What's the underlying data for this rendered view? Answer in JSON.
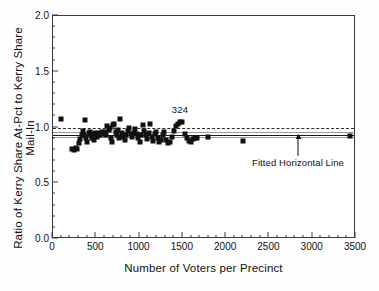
{
  "chart_data": {
    "type": "scatter",
    "title": "",
    "xlabel": "Number of Voters per Precinct",
    "ylabel": "Ratio of Kerry Share At-Pct to Kerry Share Mail-In",
    "xlim": [
      0,
      3500
    ],
    "ylim": [
      0.0,
      2.0
    ],
    "x_major_ticks": [
      0,
      500,
      1000,
      1500,
      2000,
      2500,
      3000,
      3500
    ],
    "x_tick_labels": [
      "0",
      "500",
      "1000",
      "1500",
      "2000",
      "2500",
      "3000",
      "3500"
    ],
    "x_minor_step": 100,
    "y_major_ticks": [
      0.0,
      0.5,
      1.0,
      1.5,
      2.0
    ],
    "y_tick_labels": [
      "0.0",
      "0.5",
      "1.0",
      "1.5",
      "2.0"
    ],
    "y_minor_step": 0.1,
    "grid": false,
    "legend": null,
    "marker": "filled-square",
    "marker_color": "#111111",
    "points": [
      [
        95,
        1.075
      ],
      [
        215,
        0.805
      ],
      [
        240,
        0.8
      ],
      [
        262,
        0.815
      ],
      [
        278,
        0.808
      ],
      [
        300,
        0.862
      ],
      [
        312,
        0.9
      ],
      [
        330,
        0.93
      ],
      [
        345,
        0.965
      ],
      [
        358,
        0.935
      ],
      [
        372,
        1.07
      ],
      [
        385,
        0.905
      ],
      [
        398,
        0.872
      ],
      [
        412,
        0.948
      ],
      [
        425,
        0.962
      ],
      [
        440,
        0.93
      ],
      [
        452,
        0.905
      ],
      [
        468,
        0.885
      ],
      [
        480,
        0.955
      ],
      [
        495,
        0.938
      ],
      [
        512,
        0.915
      ],
      [
        530,
        0.948
      ],
      [
        548,
        0.93
      ],
      [
        562,
        0.962
      ],
      [
        578,
        0.942
      ],
      [
        595,
        0.958
      ],
      [
        612,
        0.935
      ],
      [
        628,
        1.015
      ],
      [
        642,
        0.978
      ],
      [
        655,
        0.995
      ],
      [
        668,
        0.905
      ],
      [
        680,
        0.872
      ],
      [
        695,
        1.02
      ],
      [
        710,
        1.032
      ],
      [
        722,
        0.958
      ],
      [
        735,
        0.93
      ],
      [
        748,
        0.975
      ],
      [
        762,
        0.908
      ],
      [
        778,
        1.075
      ],
      [
        795,
        0.952
      ],
      [
        812,
        0.918
      ],
      [
        828,
        0.888
      ],
      [
        845,
        0.935
      ],
      [
        862,
        0.968
      ],
      [
        880,
        0.995
      ],
      [
        898,
        0.945
      ],
      [
        915,
        0.912
      ],
      [
        932,
        0.955
      ],
      [
        948,
        0.985
      ],
      [
        968,
        0.94
      ],
      [
        985,
        0.905
      ],
      [
        1002,
        0.872
      ],
      [
        1020,
        0.93
      ],
      [
        1038,
        1.02
      ],
      [
        1055,
        0.968
      ],
      [
        1072,
        0.935
      ],
      [
        1090,
        0.895
      ],
      [
        1108,
        0.948
      ],
      [
        1125,
        1.032
      ],
      [
        1142,
        0.918
      ],
      [
        1158,
        0.882
      ],
      [
        1175,
        0.938
      ],
      [
        1195,
        0.962
      ],
      [
        1212,
        0.905
      ],
      [
        1230,
        0.872
      ],
      [
        1248,
        0.892
      ],
      [
        1268,
        0.932
      ],
      [
        1285,
        0.958
      ],
      [
        1305,
        0.888
      ],
      [
        1325,
        0.862
      ],
      [
        1348,
        0.872
      ],
      [
        1372,
        0.915
      ],
      [
        1395,
        0.968
      ],
      [
        1418,
        1.012
      ],
      [
        1442,
        1.03
      ],
      [
        1468,
        1.052
      ],
      [
        1492,
        1.048
      ],
      [
        1520,
        0.938
      ],
      [
        1545,
        0.905
      ],
      [
        1568,
        0.878
      ],
      [
        1592,
        0.872
      ],
      [
        1615,
        0.898
      ],
      [
        1642,
        0.908
      ],
      [
        1668,
        0.905
      ],
      [
        1790,
        0.912
      ],
      [
        2190,
        0.878
      ],
      [
        3430,
        0.922
      ]
    ],
    "reference_lines": [
      {
        "name": "unity-dashed-line",
        "y": 1.0,
        "style": "dashed",
        "color": "#2b2b2b"
      },
      {
        "name": "fitted-horizontal-line",
        "y": 0.931,
        "style": "solid",
        "color": "#1a1a1a"
      },
      {
        "name": "confidence-band-upper",
        "y": 0.957,
        "style": "thin-solid",
        "color": "#9a9a9a"
      },
      {
        "name": "confidence-band-lower",
        "y": 0.918,
        "style": "thin-solid",
        "color": "#9a9a9a"
      }
    ],
    "annotations": [
      {
        "name": "point-label-324",
        "text": "324",
        "x": 1468,
        "y": 1.075
      },
      {
        "name": "fitted-line-callout",
        "text": "Fitted Horizontal Line",
        "x": 2830,
        "y": 0.74,
        "arrow_to_y": 0.931
      }
    ]
  },
  "axes": {
    "x_title": "Number of Voters per Precinct",
    "y_title": "Ratio of Kerry Share At-Pct to Kerry Share Mail-In"
  },
  "caption": {
    "partial_text": ""
  }
}
